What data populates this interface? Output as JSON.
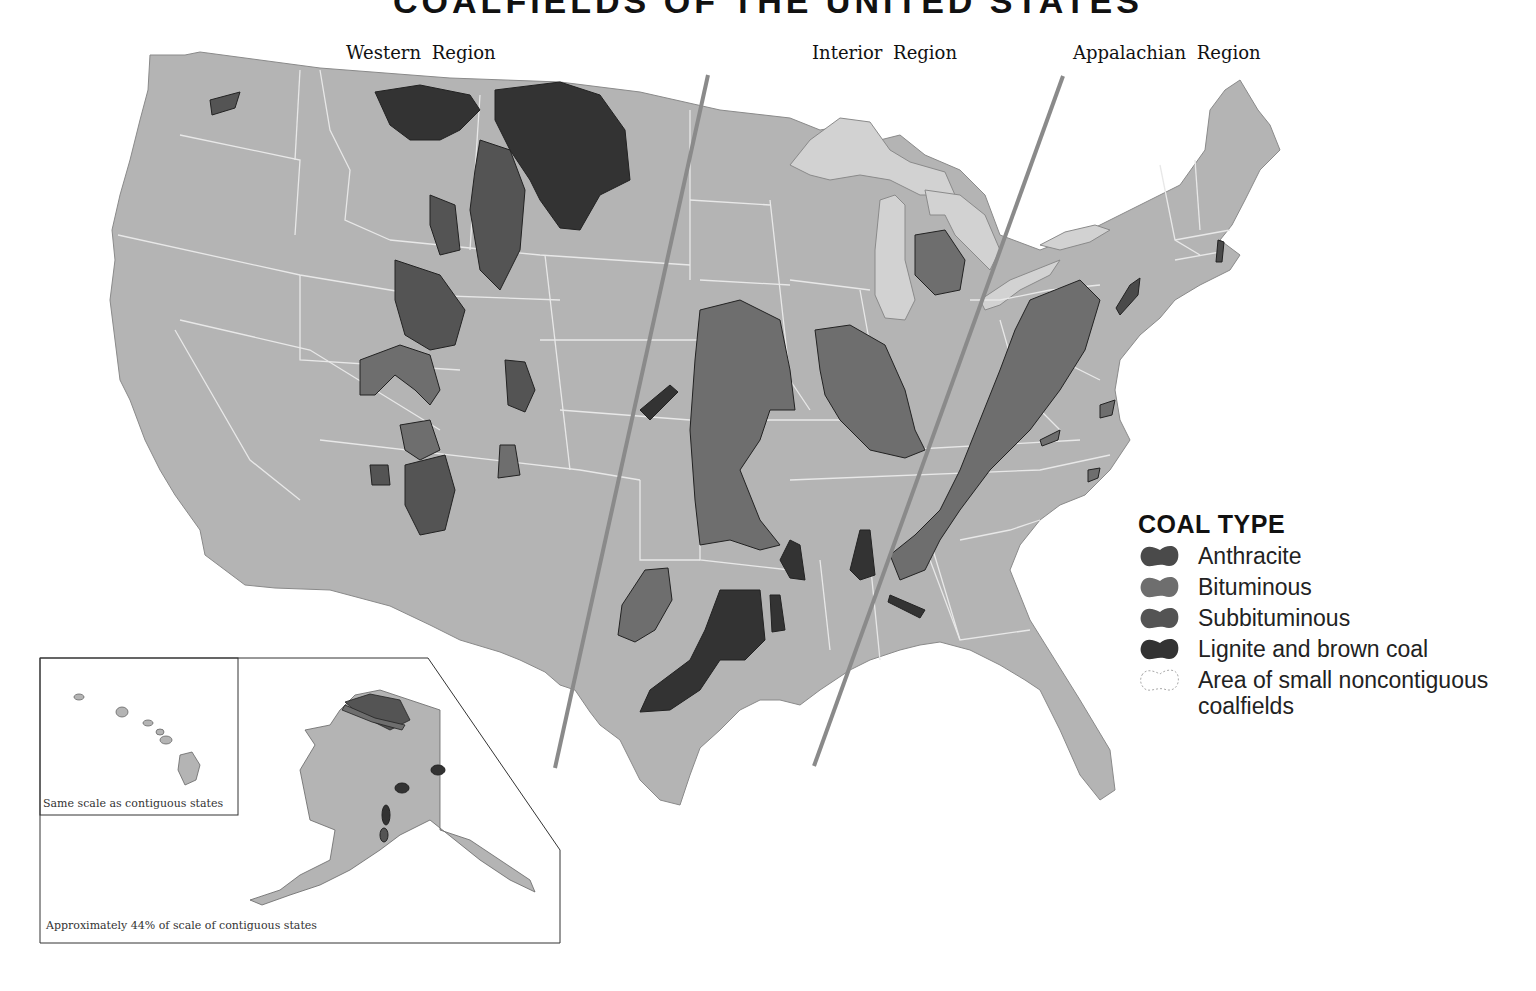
{
  "title": "COALFIELDS OF THE UNITED STATES",
  "regions": [
    {
      "name": "Western Region"
    },
    {
      "name": "Interior Region"
    },
    {
      "name": "Appalachian Region"
    }
  ],
  "legend": {
    "title": "COAL TYPE",
    "items": [
      {
        "label": "Anthracite",
        "color": "#4a4a4a",
        "icon": "anthracite-swatch"
      },
      {
        "label": "Bituminous",
        "color": "#6e6e6e",
        "icon": "bituminous-swatch"
      },
      {
        "label": "Subbituminous",
        "color": "#545454",
        "icon": "subbituminous-swatch"
      },
      {
        "label": "Lignite and brown coal",
        "color": "#333333",
        "icon": "lignite-swatch"
      },
      {
        "label": "Area of small noncontiguous coalfields",
        "color": "#aaaaaa",
        "icon": "dotted-outline-swatch"
      }
    ]
  },
  "insets": {
    "hawaii_caption": "Same scale as contiguous states",
    "alaska_caption": "Approximately 44% of scale of contiguous states"
  },
  "colors": {
    "land": "#b4b4b4",
    "great_lakes": "#d2d2d2",
    "state_border": "#e8e8e8",
    "divider": "#8a8a8a",
    "background": "#ffffff"
  }
}
